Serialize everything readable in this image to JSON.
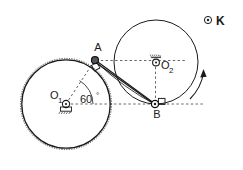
{
  "figure": {
    "background_color": "#ffffff",
    "stroke_color": "#1a1a1a",
    "width": 243,
    "height": 170
  },
  "labels": {
    "point_a": "A",
    "point_b": "B",
    "pivot_o1_base": "O",
    "pivot_o1_sub": "1",
    "pivot_o2_base": "O",
    "pivot_o2_sub": "2",
    "angle": "60",
    "angle_unit": "°",
    "marker_k": "K"
  },
  "geometry": {
    "left_circle": {
      "cx": 66,
      "cy": 104,
      "r": 45
    },
    "right_circle": {
      "cx": 156,
      "cy": 62,
      "r": 42
    },
    "point_a": {
      "x": 95,
      "y": 60
    },
    "point_b": {
      "x": 155,
      "y": 104
    },
    "pivot_o1": {
      "x": 66,
      "y": 104
    },
    "pivot_o2": {
      "x": 156,
      "y": 62
    },
    "marker_k_dot": {
      "x": 208,
      "y": 20
    },
    "angle_value_deg": 60,
    "datum_line_y": 104,
    "datum_line_x_start": 66,
    "datum_line_x_end": 205
  },
  "annotations": {
    "rotation_arrow": "counterclockwise-arc-arrow",
    "o1_support": "fixed-pivot-hatched-support",
    "o2_support": "fixed-pivot-hatched-support",
    "a_joint": "pin-joint",
    "b_joint": "pin-joint-with-slider-block",
    "connecting_rod": "double-line-rod-A-to-B"
  },
  "icons": {
    "k_marker": "target-circle-dot-icon",
    "arrow_head": "arrow-head-icon"
  }
}
